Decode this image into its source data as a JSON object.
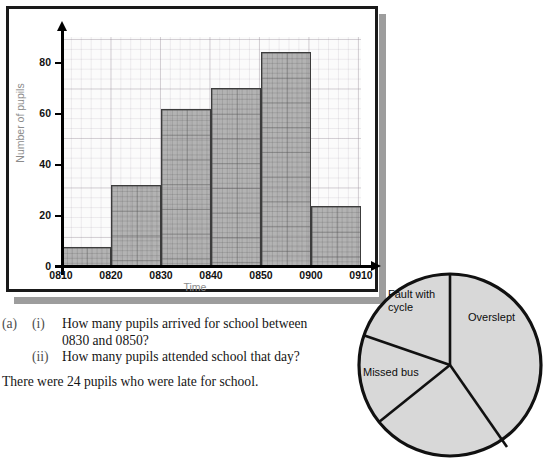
{
  "chart_data": {
    "type": "bar",
    "title": "",
    "xlabel": "Time",
    "ylabel": "Number of pupils",
    "categories": [
      "0810-0820",
      "0820-0830",
      "0830-0840",
      "0840-0850",
      "0850-0900",
      "0900-0910"
    ],
    "bin_edges": [
      "0810",
      "0820",
      "0830",
      "0840",
      "0850",
      "0900",
      "0910"
    ],
    "values": [
      8,
      32,
      62,
      70,
      84,
      24
    ],
    "ylim": [
      0,
      90
    ],
    "yticks": [
      0,
      20,
      40,
      60,
      80
    ],
    "ytick_labels": [
      "0",
      "20",
      "40",
      "60",
      "80"
    ],
    "xtick_labels": [
      "0810",
      "0820",
      "0830",
      "0840",
      "0850",
      "0900",
      "0910"
    ],
    "grid": true,
    "legend": "none",
    "bar_fill_color": "#8a8a8a",
    "bar_edge_color": "#3c3c3c"
  },
  "questions": {
    "part_label": "(a)",
    "items": [
      {
        "roman": "(i)",
        "line1": "How many pupils arrived for school between",
        "line2": "0830 and 0850?"
      },
      {
        "roman": "(ii)",
        "line1": "How many pupils attended school that day?",
        "line2": ""
      }
    ],
    "trailing_text": "There were 24 pupils who were late for school."
  },
  "pie_chart": {
    "type": "pie",
    "title": "",
    "labels": [
      "Overslept",
      "Fault with cycle",
      "Missed bus"
    ],
    "label_fault_line1": "Fault with",
    "label_fault_line2": "cycle",
    "label_overslept": "Overslept",
    "label_missed": "Missed bus",
    "fill_color": "#d8d8d8",
    "edge_color": "#111111"
  }
}
